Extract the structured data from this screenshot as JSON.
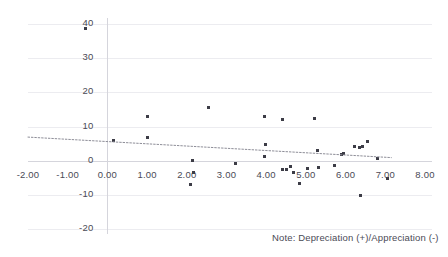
{
  "chart_data": {
    "type": "scatter",
    "title": "",
    "subtitle": "",
    "xlabel": "",
    "ylabel": "",
    "xlim": [
      -2.0,
      8.0
    ],
    "ylim": [
      -20,
      40
    ],
    "grid": true,
    "legend": false,
    "xticks": [
      "-2.00",
      "-1.00",
      "0.00",
      "1.00",
      "2.00",
      "3.00",
      "4.00",
      "5.00",
      "6.00",
      "7.00",
      "8.00"
    ],
    "xtick_values": [
      -2,
      -1,
      0,
      1,
      2,
      3,
      4,
      5,
      6,
      7,
      8
    ],
    "yticks": [
      "40",
      "30",
      "20",
      "10",
      "0",
      "-10",
      "-20"
    ],
    "ytick_values": [
      40,
      30,
      20,
      10,
      0,
      -10,
      -20
    ],
    "annotation": "Note: Depreciation (+)/Appreciation (-)",
    "point_color": "#3c3c46",
    "gridline_color": "#ececf0",
    "axis_color": "#d5d5dc",
    "trendline_color": "#8e8e98",
    "trendline_style": "dotted",
    "series": [
      {
        "name": "observations",
        "points": [
          [
            -0.55,
            38.6
          ],
          [
            0.15,
            6.0
          ],
          [
            1.0,
            13.0
          ],
          [
            1.02,
            6.8
          ],
          [
            2.15,
            0.0
          ],
          [
            2.18,
            -3.6
          ],
          [
            2.1,
            -7.0
          ],
          [
            2.55,
            15.6
          ],
          [
            3.22,
            -0.8
          ],
          [
            3.95,
            13.0
          ],
          [
            3.98,
            4.8
          ],
          [
            3.95,
            1.2
          ],
          [
            4.42,
            12.0
          ],
          [
            4.4,
            -2.7
          ],
          [
            4.52,
            -2.6
          ],
          [
            4.6,
            -1.8
          ],
          [
            4.68,
            -3.5
          ],
          [
            5.05,
            -2.2
          ],
          [
            5.22,
            12.4
          ],
          [
            5.3,
            3.1
          ],
          [
            5.32,
            -2.1
          ],
          [
            4.85,
            -6.8
          ],
          [
            5.72,
            -1.5
          ],
          [
            5.9,
            1.8
          ],
          [
            5.95,
            2.2
          ],
          [
            6.22,
            4.2
          ],
          [
            6.35,
            4.0
          ],
          [
            6.42,
            4.1
          ],
          [
            6.38,
            -10.2
          ],
          [
            6.55,
            5.6
          ],
          [
            6.8,
            0.5
          ],
          [
            7.05,
            -5.2
          ]
        ]
      }
    ],
    "trendline": {
      "name": "linear-fit",
      "x_start": -2.0,
      "y_start": 6.9,
      "x_end": 7.15,
      "y_end": 0.9
    }
  }
}
